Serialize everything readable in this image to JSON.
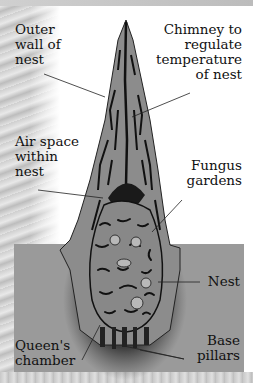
{
  "diagram": {
    "colors": {
      "ground": "#9a9a9a",
      "nest_body": "#8a8a8a",
      "tunnels": "#1a1a1a",
      "text": "#111111",
      "background": "#ffffff"
    },
    "labels": {
      "outer_wall": [
        "Outer",
        "wall of",
        "nest"
      ],
      "chimney": [
        "Chimney to",
        "regulate",
        "temperature",
        "of nest"
      ],
      "air_space": [
        "Air space",
        "within",
        "nest"
      ],
      "fungus": [
        "Fungus",
        "gardens"
      ],
      "nest": [
        "Nest"
      ],
      "queens_chamber": [
        "Queen's",
        "chamber"
      ],
      "base_pillars": [
        "Base",
        "pillars"
      ]
    }
  }
}
